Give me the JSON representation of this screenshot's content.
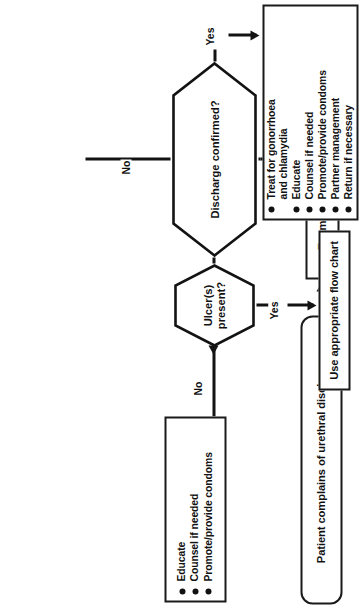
{
  "chart": {
    "orientation": "rotated-90-ccw",
    "colors": {
      "ink": "#131313",
      "paper": "#ffffff"
    },
    "nodes": {
      "start": {
        "id": "start",
        "shape": "rounded-rectangle",
        "text": "Patient complains of urethral discharge"
      },
      "examine": {
        "id": "examine",
        "shape": "rectangle",
        "text": "Examine: milk urethra if necessary"
      },
      "discharge_decision": {
        "id": "discharge-confirmed",
        "shape": "hexagon",
        "text": "Discharge confirmed?"
      },
      "ulcer_decision": {
        "id": "ulcers-present",
        "shape": "hexagon",
        "line1": "Ulcer(s)",
        "line2": "present?"
      },
      "treat_box": {
        "id": "treat-actions",
        "shape": "rectangle",
        "items": [
          {
            "text": "Treat for gonorrhoea",
            "cont": "and chlamydia"
          },
          {
            "text": "Educate"
          },
          {
            "text": "Counsel if needed"
          },
          {
            "text": "Promote/provide condoms"
          },
          {
            "text": "Partner management"
          },
          {
            "text": "Return if necessary"
          }
        ]
      },
      "flowchart_box": {
        "id": "use-appropriate-flow-chart",
        "shape": "rectangle",
        "text": "Use appropriate flow chart"
      },
      "educate_box": {
        "id": "educate-actions",
        "shape": "rectangle",
        "items": [
          {
            "text": "Educate"
          },
          {
            "text": "Counsel if needed"
          },
          {
            "text": "Promote/provide condoms"
          }
        ]
      }
    },
    "edge_labels": {
      "discharge_yes": "Yes",
      "discharge_no": "No",
      "ulcer_yes": "Yes",
      "ulcer_no": "No"
    }
  }
}
